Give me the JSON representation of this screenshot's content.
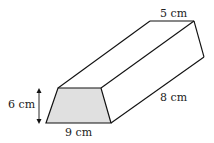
{
  "diagram": {
    "type": "trapezoidal prism",
    "labels": {
      "top_width": "5 cm",
      "height": "6 cm",
      "length": "8 cm",
      "bottom_width": "9 cm"
    },
    "colors": {
      "face_fill": "#e0e0e0",
      "stroke": "#111111"
    }
  }
}
